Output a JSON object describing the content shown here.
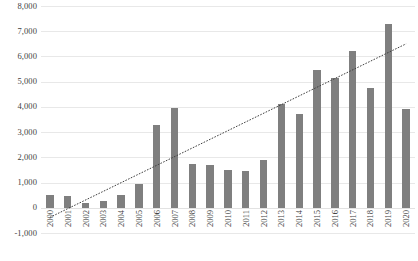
{
  "chart_data": {
    "type": "bar",
    "title": "",
    "xlabel": "",
    "ylabel": "",
    "categories": [
      "2000",
      "2001",
      "2002",
      "2003",
      "2004",
      "2005",
      "2006",
      "2007",
      "2008",
      "2009",
      "2010",
      "2011",
      "2012",
      "2013",
      "2014",
      "2015",
      "2016",
      "2017",
      "2018",
      "2019",
      "2020"
    ],
    "values": [
      500,
      480,
      180,
      250,
      500,
      950,
      3280,
      3950,
      1750,
      1700,
      1500,
      1450,
      1900,
      4100,
      3700,
      5450,
      5150,
      6200,
      4750,
      7300,
      3900
    ],
    "series": [
      {
        "name": "Count",
        "values": [
          500,
          480,
          180,
          250,
          500,
          950,
          3280,
          3950,
          1750,
          1700,
          1500,
          1450,
          1900,
          4100,
          3700,
          5450,
          5150,
          6200,
          4750,
          7300,
          3900
        ],
        "color": "#7f7f7f"
      },
      {
        "name": "Linear trendline",
        "type": "line",
        "style": "dotted",
        "color": "#404040",
        "start_value": -380,
        "end_value": 6500
      }
    ],
    "ylim": [
      -1000,
      8000
    ],
    "ytick_step": 1000,
    "ytick_labels": [
      "8,000",
      "7,000",
      "6,000",
      "5,000",
      "4,000",
      "3,000",
      "2,000",
      "1,000",
      "0",
      "-1,000"
    ],
    "ytick_values": [
      8000,
      7000,
      6000,
      5000,
      4000,
      3000,
      2000,
      1000,
      0,
      -1000
    ],
    "grid": true,
    "legend": "none",
    "bar_color": "#7f7f7f",
    "gridline_color": "#e8e8e8",
    "background": "#ffffff"
  }
}
